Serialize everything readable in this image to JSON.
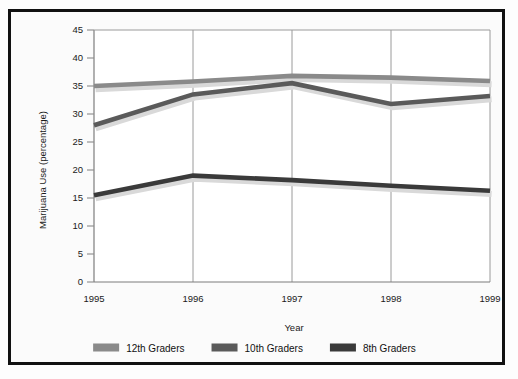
{
  "chart_data": {
    "type": "line",
    "title": "",
    "xlabel": "Year",
    "ylabel": "Marijuana Use (percentage)",
    "categories": [
      "1995",
      "1996",
      "1997",
      "1998",
      "1999"
    ],
    "x": [
      1995,
      1996,
      1997,
      1998,
      1999
    ],
    "xlim": [
      1995,
      1999
    ],
    "ylim": [
      0,
      45
    ],
    "yticks": [
      "0",
      "5",
      "10",
      "15",
      "20",
      "25",
      "30",
      "35",
      "40",
      "45"
    ],
    "ytick_values": [
      0,
      5,
      10,
      15,
      20,
      25,
      30,
      35,
      40,
      45
    ],
    "ytick_step": 5,
    "grid": "vertical",
    "legend_position": "bottom",
    "series": [
      {
        "name": "12th Graders",
        "color": "#8a8a8a",
        "values": [
          35.0,
          35.8,
          36.8,
          36.5,
          35.9
        ]
      },
      {
        "name": "10th Graders",
        "color": "#5a5a5a",
        "values": [
          28.0,
          33.5,
          35.5,
          31.8,
          33.2
        ]
      },
      {
        "name": "8th Graders",
        "color": "#3a3a3a",
        "values": [
          15.5,
          19.0,
          18.2,
          17.2,
          16.3
        ]
      }
    ]
  },
  "legend": {
    "items": [
      {
        "label": "12th Graders",
        "swatch": "#8a8a8a"
      },
      {
        "label": "10th Graders",
        "swatch": "#5a5a5a"
      },
      {
        "label": "8th Graders",
        "swatch": "#3a3a3a"
      }
    ]
  },
  "axes": {
    "y_title": "Marijuana Use (percentage)",
    "x_title": "Year",
    "y_ticks": [
      "45",
      "40",
      "35",
      "30",
      "25",
      "20",
      "15",
      "10",
      "5",
      "0"
    ],
    "x_ticks": [
      "1995",
      "1996",
      "1997",
      "1998",
      "1999"
    ]
  },
  "colors": {
    "frame": "#111111",
    "plot_background": "#ffffff",
    "figure_background": "#fbfbfb",
    "gridline": "#9a9a9a",
    "shadow": "#d9d9d9",
    "text": "#1a1a1a"
  }
}
